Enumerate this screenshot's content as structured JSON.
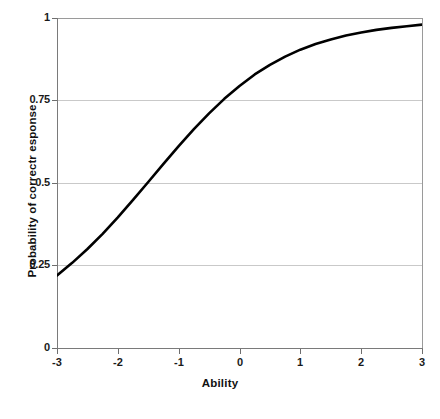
{
  "chart_data": {
    "type": "line",
    "title": "",
    "xlabel": "Ability",
    "ylabel": "Probability of correctr esponse",
    "xlim": [
      -3,
      3
    ],
    "ylim": [
      0,
      1
    ],
    "grid": true,
    "legend": "none",
    "x_ticks": [
      "-3",
      "-2",
      "-1",
      "0",
      "1",
      "2",
      "3"
    ],
    "x_tick_values": [
      -3,
      -2,
      -1,
      0,
      1,
      2,
      3
    ],
    "y_ticks": [
      "0",
      "0.25",
      "0.5",
      "0.75",
      "1"
    ],
    "y_tick_values": [
      0,
      0.25,
      0.5,
      0.75,
      1
    ],
    "series": [
      {
        "name": "Item characteristic curve",
        "color": "#000000",
        "x": [
          -3.0,
          -2.75,
          -2.5,
          -2.25,
          -2.0,
          -1.75,
          -1.5,
          -1.25,
          -1.0,
          -0.75,
          -0.5,
          -0.25,
          0.0,
          0.25,
          0.5,
          0.75,
          1.0,
          1.25,
          1.5,
          1.75,
          2.0,
          2.25,
          2.5,
          2.75,
          3.0
        ],
        "y": [
          0.22,
          0.258,
          0.3,
          0.346,
          0.396,
          0.449,
          0.503,
          0.558,
          0.612,
          0.663,
          0.711,
          0.755,
          0.794,
          0.829,
          0.858,
          0.883,
          0.904,
          0.921,
          0.935,
          0.947,
          0.956,
          0.964,
          0.97,
          0.975,
          0.98
        ]
      }
    ]
  },
  "axes": {
    "x_title": "Ability",
    "y_title": "Probability of correctr esponse"
  }
}
